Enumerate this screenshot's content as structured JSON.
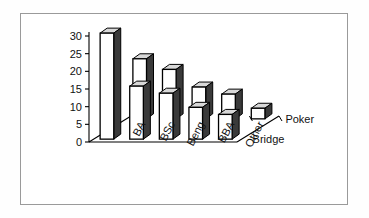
{
  "chart_data": {
    "type": "bar",
    "title": "",
    "subtitle": "",
    "xlabel": "",
    "ylabel": "",
    "zlabel": "",
    "categories": [
      "BA",
      "BSc",
      "Beng",
      "BBA",
      "Other"
    ],
    "series": [
      {
        "name": "Poker",
        "values": [
          17,
          14,
          9,
          7,
          3
        ]
      },
      {
        "name": "Bridge",
        "values": [
          30,
          15,
          13,
          9,
          7
        ]
      }
    ],
    "ylim": [
      0,
      30
    ],
    "yticks": [
      0,
      5,
      10,
      15,
      20,
      25,
      30
    ],
    "ytick_labels": [
      "0",
      "5",
      "10",
      "15",
      "20",
      "25",
      "30"
    ],
    "grid": false,
    "legend": "depth-axis",
    "projection": "3d",
    "bar_fill": "#ffffff",
    "bar_edge": "#000000",
    "bar_side_shade": "#3a3a3a",
    "bar_top_shade": "#d8d8d8",
    "axis_color": "#000000",
    "frame_color": "#9a9a9a",
    "background": "#ffffff"
  }
}
